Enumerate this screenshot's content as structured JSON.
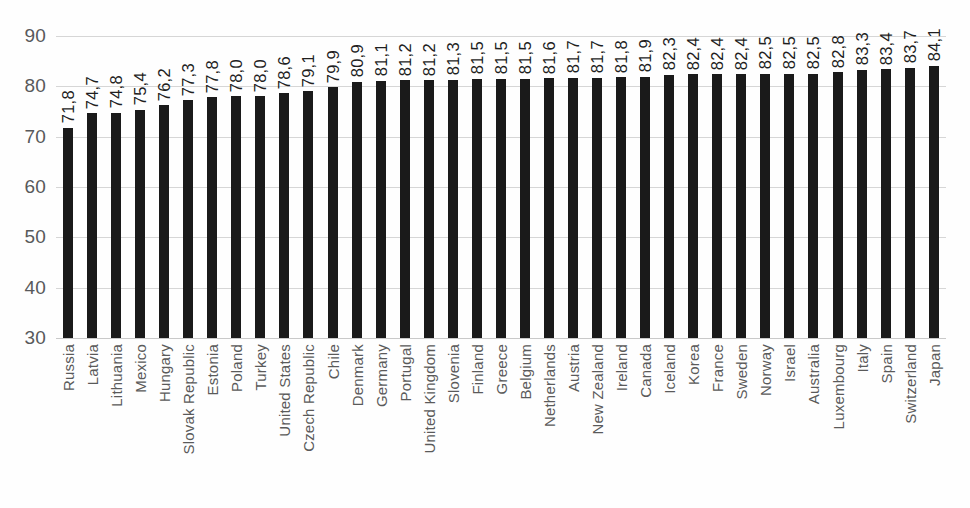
{
  "chart_data": {
    "type": "bar",
    "title": "",
    "subtitle": "",
    "xlabel": "",
    "ylabel": "",
    "ylim": [
      30,
      90
    ],
    "ytick_step": 10,
    "ytick_labels": [
      "90",
      "80",
      "70",
      "60",
      "50",
      "40",
      "30"
    ],
    "ytick_values": [
      90,
      80,
      70,
      60,
      50,
      40,
      30
    ],
    "grid": true,
    "grid_axis": "y",
    "legend": false,
    "legend_position": "none",
    "decimal_separator": ",",
    "bar_color": "#1a1a1a",
    "grid_color": "#d6d6d6",
    "background_color": "#fefefe",
    "label_color": "#5a5a5a",
    "value_label_rotation": 90,
    "category_label_rotation": 90,
    "categories": [
      "Russia",
      "Latvia",
      "Lithuania",
      "Mexico",
      "Hungary",
      "Slovak Republic",
      "Estonia",
      "Poland",
      "Turkey",
      "United States",
      "Czech Republic",
      "Chile",
      "Denmark",
      "Germany",
      "Portugal",
      "United Kingdom",
      "Slovenia",
      "Finland",
      "Greece",
      "Belgium",
      "Netherlands",
      "Austria",
      "New Zealand",
      "Ireland",
      "Canada",
      "Iceland",
      "Korea",
      "France",
      "Sweden",
      "Norway",
      "Israel",
      "Australia",
      "Luxembourg",
      "Italy",
      "Spain",
      "Switzerland",
      "Japan"
    ],
    "values": [
      71.8,
      74.7,
      74.8,
      75.4,
      76.2,
      77.3,
      77.8,
      78.0,
      78.0,
      78.6,
      79.1,
      79.9,
      80.9,
      81.1,
      81.2,
      81.2,
      81.3,
      81.5,
      81.5,
      81.5,
      81.6,
      81.7,
      81.7,
      81.8,
      81.9,
      82.3,
      82.4,
      82.4,
      82.4,
      82.5,
      82.5,
      82.5,
      82.8,
      83.3,
      83.4,
      83.7,
      84.1
    ],
    "value_labels": [
      "71,8",
      "74,7",
      "74,8",
      "75,4",
      "76,2",
      "77,3",
      "77,8",
      "78,0",
      "78,0",
      "78,6",
      "79,1",
      "79,9",
      "80,9",
      "81,1",
      "81,2",
      "81,2",
      "81,3",
      "81,5",
      "81,5",
      "81,5",
      "81,6",
      "81,7",
      "81,7",
      "81,8",
      "81,9",
      "82,3",
      "82,4",
      "82,4",
      "82,4",
      "82,5",
      "82,5",
      "82,5",
      "82,8",
      "83,3",
      "83,4",
      "83,7",
      "84,1"
    ]
  }
}
